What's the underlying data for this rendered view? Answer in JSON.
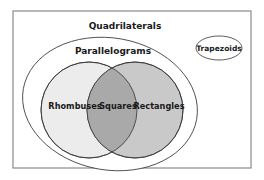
{
  "diagram": {
    "type": "venn",
    "frame": {
      "stroke": "#8a8a8a"
    },
    "sets": [
      {
        "id": "quadrilaterals",
        "label": "Quadrilaterals",
        "fill": "#ffffff"
      },
      {
        "id": "parallelograms",
        "label": "Parallelograms",
        "fill": "#ffffff"
      },
      {
        "id": "rhombuses",
        "label": "Rhombuses",
        "fill": "#ececec"
      },
      {
        "id": "rectangles",
        "label": "Rectangles",
        "fill": "#c9c9c9"
      },
      {
        "id": "squares",
        "label": "Squares",
        "fill": "#a9a9a9"
      },
      {
        "id": "trapezoids",
        "label": "Trapezoids",
        "fill": "#ffffff"
      }
    ],
    "labels": {
      "quadrilaterals": "Quadrilaterals",
      "parallelograms": "Parallelograms",
      "rhombuses": "Rhombuses",
      "squares": "Squares",
      "rectangles": "Rectangles",
      "trapezoids": "Trapezoids"
    }
  }
}
